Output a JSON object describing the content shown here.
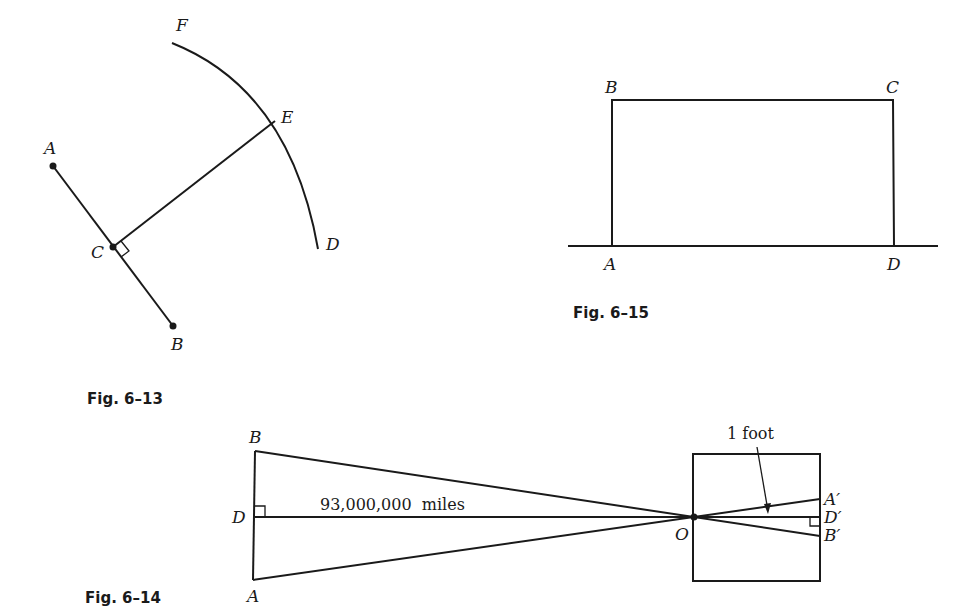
{
  "figures": [
    {
      "caption": "Fig. 6–13",
      "points": {
        "A": "A",
        "B": "B",
        "C": "C",
        "D": "D",
        "E": "E",
        "F": "F"
      },
      "description": "Segment AB with point C, perpendicular CE to arc FD"
    },
    {
      "caption": "Fig. 6–14",
      "points": {
        "A": "A",
        "B": "B",
        "D": "D",
        "O": "O",
        "A_prime": "A′",
        "B_prime": "B′",
        "D_prime": "D′"
      },
      "distance_label": "93,000,000  miles",
      "size_label": "1 foot"
    },
    {
      "caption": "Fig. 6–15",
      "points": {
        "A": "A",
        "B": "B",
        "C": "C",
        "D": "D"
      },
      "description": "Rectangle ABCD on a line"
    }
  ]
}
